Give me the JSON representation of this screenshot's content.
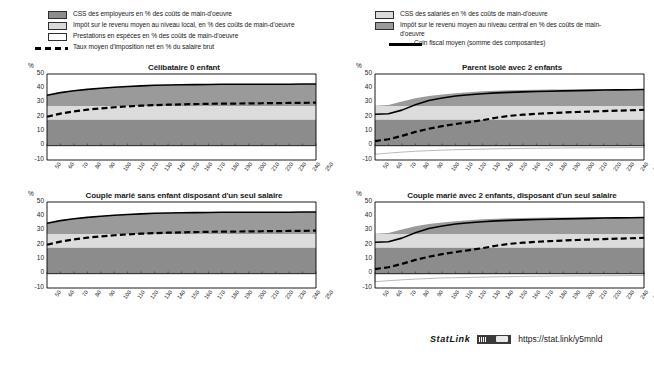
{
  "legend": {
    "left_items": [
      {
        "type": "swatch",
        "color": "#8c8c8c",
        "label": "CSS des employeurs en % des coûts de main-d'oeuvre"
      },
      {
        "type": "swatch",
        "color": "#d9d9d9",
        "label": "Impôt sur le revenu moyen au niveau local, en % des coûts de main-d'oeuvre"
      },
      {
        "type": "swatch",
        "color": "#ffffff",
        "label": "Prestations en espèces en % des coûts de main-d'oeuvre"
      },
      {
        "type": "dashed",
        "color": "#000000",
        "label": "Taux moyen d'imposition net en % du salaire brut"
      }
    ],
    "right_items": [
      {
        "type": "swatch",
        "color": "#dcdcdc",
        "label": "CSS des salariés en % des coûts de main-d'oeuvre"
      },
      {
        "type": "swatch",
        "color": "#9a9a9a",
        "label": "Impôt sur le revenu moyen au niveau central en %  des coûts de main-d'oeuvre"
      },
      {
        "type": "solid",
        "color": "#000000",
        "label": "Coin fiscal moyen (somme des composantes)"
      }
    ]
  },
  "axis": {
    "y_label": "%",
    "y_ticks": [
      50,
      40,
      30,
      20,
      10,
      0,
      -10
    ],
    "y_min": -10,
    "y_max": 50,
    "x_ticks": [
      50,
      60,
      70,
      80,
      90,
      100,
      110,
      120,
      130,
      140,
      150,
      160,
      170,
      180,
      190,
      200,
      210,
      220,
      230,
      240,
      250
    ],
    "x_min": 50,
    "x_max": 250
  },
  "footer": {
    "statlink_label": "StatLink",
    "url": "https://stat.link/y5mnld"
  },
  "chart_data": [
    {
      "type": "area",
      "id": "celibataire-0-enfant",
      "title": "Célibataire 0 enfant",
      "xlabel": "",
      "ylabel": "%",
      "xlim": [
        50,
        250
      ],
      "ylim": [
        -10,
        50
      ],
      "x": [
        50,
        60,
        70,
        80,
        90,
        100,
        110,
        120,
        130,
        140,
        150,
        160,
        170,
        180,
        190,
        200,
        210,
        220,
        230,
        240,
        250
      ],
      "series": [
        {
          "name": "CSS des employeurs",
          "color": "#8c8c8c",
          "values": [
            18.2,
            18.2,
            18.2,
            18.2,
            18.2,
            18.2,
            18.2,
            18.2,
            18.2,
            18.2,
            18.2,
            18.2,
            18.2,
            18.2,
            18.2,
            18.2,
            18.2,
            18.2,
            18.2,
            18.2,
            18.2
          ]
        },
        {
          "name": "CSS des salariés",
          "color": "#dcdcdc",
          "values": [
            9.5,
            9.5,
            9.5,
            9.5,
            9.5,
            9.5,
            9.5,
            9.5,
            9.5,
            9.5,
            9.5,
            9.5,
            9.5,
            9.5,
            9.5,
            9.5,
            9.5,
            9.5,
            9.5,
            9.5,
            9.5
          ]
        },
        {
          "name": "Impôt sur le revenu moyen au niveau central",
          "color": "#9a9a9a",
          "values": [
            7.5,
            9.3,
            10.6,
            11.6,
            12.4,
            13.1,
            13.6,
            14.0,
            14.4,
            14.6,
            14.8,
            14.9,
            15.0,
            15.1,
            15.1,
            15.2,
            15.2,
            15.2,
            15.2,
            15.3,
            15.3
          ]
        },
        {
          "name": "Impôt sur le revenu moyen au niveau local",
          "color": "#d9d9d9",
          "values": [
            0,
            0,
            0,
            0,
            0,
            0,
            0,
            0,
            0,
            0,
            0,
            0,
            0,
            0,
            0,
            0,
            0,
            0,
            0,
            0,
            0
          ]
        },
        {
          "name": "Prestations en espèces",
          "color": "#ffffff",
          "values": [
            0,
            0,
            0,
            0,
            0,
            0,
            0,
            0,
            0,
            0,
            0,
            0,
            0,
            0,
            0,
            0,
            0,
            0,
            0,
            0,
            0
          ]
        }
      ],
      "lines": [
        {
          "name": "Coin fiscal moyen (somme des composantes)",
          "style": "solid",
          "color": "#000000",
          "values": [
            35.2,
            37.0,
            38.3,
            39.3,
            40.1,
            40.8,
            41.3,
            41.7,
            42.1,
            42.3,
            42.5,
            42.6,
            42.7,
            42.8,
            42.8,
            42.9,
            42.9,
            42.9,
            42.9,
            43.0,
            43.0
          ]
        },
        {
          "name": "Taux moyen d'imposition net en % du salaire brut",
          "style": "dashed",
          "color": "#000000",
          "values": [
            20.2,
            22.4,
            23.9,
            25.1,
            26.0,
            26.8,
            27.4,
            27.9,
            28.3,
            28.6,
            28.8,
            29.0,
            29.2,
            29.3,
            29.4,
            29.5,
            29.6,
            29.7,
            29.8,
            29.9,
            30.0
          ]
        }
      ]
    },
    {
      "type": "area",
      "id": "parent-isole-2-enfants",
      "title": "Parent isolé avec 2 enfants",
      "xlabel": "",
      "ylabel": "%",
      "xlim": [
        50,
        250
      ],
      "ylim": [
        -10,
        50
      ],
      "x": [
        50,
        60,
        70,
        80,
        90,
        100,
        110,
        120,
        130,
        140,
        150,
        160,
        170,
        180,
        190,
        200,
        210,
        220,
        230,
        240,
        250
      ],
      "series": [
        {
          "name": "CSS des employeurs",
          "color": "#8c8c8c",
          "values": [
            18.2,
            18.2,
            18.2,
            18.2,
            18.2,
            18.2,
            18.2,
            18.2,
            18.2,
            18.2,
            18.2,
            18.2,
            18.2,
            18.2,
            18.2,
            18.2,
            18.2,
            18.2,
            18.2,
            18.2,
            18.2
          ]
        },
        {
          "name": "CSS des salariés",
          "color": "#dcdcdc",
          "values": [
            9.5,
            9.5,
            9.5,
            9.5,
            9.5,
            9.5,
            9.5,
            9.5,
            9.5,
            9.5,
            9.5,
            9.5,
            9.5,
            9.5,
            9.5,
            9.5,
            9.5,
            9.5,
            9.5,
            9.5,
            9.5
          ]
        },
        {
          "name": "Impôt sur le revenu moyen au niveau central",
          "color": "#9a9a9a",
          "values": [
            0.2,
            0.6,
            3.1,
            5.4,
            6.9,
            8.0,
            8.9,
            9.6,
            10.2,
            10.7,
            11.0,
            11.2,
            11.3,
            11.4,
            11.5,
            11.5,
            11.6,
            11.6,
            11.6,
            11.6,
            11.7
          ]
        },
        {
          "name": "Impôt sur le revenu moyen au niveau local",
          "color": "#d9d9d9",
          "values": [
            0,
            0,
            0,
            0,
            0,
            0,
            0,
            0,
            0,
            0,
            0,
            0,
            0,
            0,
            0,
            0,
            0,
            0,
            0,
            0,
            0
          ]
        },
        {
          "name": "Prestations en espèces",
          "color": "#ffffff",
          "values": [
            -6.0,
            -5.2,
            -4.5,
            -3.9,
            -3.5,
            -3.1,
            -2.8,
            -2.6,
            -2.4,
            -2.2,
            -2.1,
            -1.9,
            -1.8,
            -1.7,
            -1.6,
            -1.5,
            -1.5,
            -1.4,
            -1.4,
            -1.3,
            -1.3
          ]
        }
      ],
      "lines": [
        {
          "name": "Coin fiscal moyen (somme des composantes)",
          "style": "solid",
          "color": "#000000",
          "values": [
            21.9,
            22.3,
            24.8,
            28.6,
            31.5,
            33.3,
            34.6,
            35.5,
            36.2,
            36.8,
            37.2,
            37.5,
            37.8,
            38.0,
            38.2,
            38.4,
            38.6,
            38.8,
            38.9,
            39.0,
            39.2
          ]
        },
        {
          "name": "Taux moyen d'imposition net en % du salaire brut",
          "style": "dashed",
          "color": "#000000",
          "values": [
            3.2,
            4.5,
            6.8,
            9.6,
            11.8,
            13.6,
            15.1,
            16.4,
            17.8,
            19.5,
            20.8,
            21.6,
            22.2,
            22.7,
            23.1,
            23.5,
            23.8,
            24.1,
            24.4,
            24.7,
            25.0
          ]
        }
      ]
    },
    {
      "type": "area",
      "id": "couple-marie-sans-enfant-un-seul-salaire",
      "title": "Couple marié sans enfant disposant d'un seul salaire",
      "xlabel": "",
      "ylabel": "%",
      "xlim": [
        50,
        250
      ],
      "ylim": [
        -10,
        50
      ],
      "x": [
        50,
        60,
        70,
        80,
        90,
        100,
        110,
        120,
        130,
        140,
        150,
        160,
        170,
        180,
        190,
        200,
        210,
        220,
        230,
        240,
        250
      ],
      "series": [
        {
          "name": "CSS des employeurs",
          "color": "#8c8c8c",
          "values": [
            18.2,
            18.2,
            18.2,
            18.2,
            18.2,
            18.2,
            18.2,
            18.2,
            18.2,
            18.2,
            18.2,
            18.2,
            18.2,
            18.2,
            18.2,
            18.2,
            18.2,
            18.2,
            18.2,
            18.2,
            18.2
          ]
        },
        {
          "name": "CSS des salariés",
          "color": "#dcdcdc",
          "values": [
            9.5,
            9.5,
            9.5,
            9.5,
            9.5,
            9.5,
            9.5,
            9.5,
            9.5,
            9.5,
            9.5,
            9.5,
            9.5,
            9.5,
            9.5,
            9.5,
            9.5,
            9.5,
            9.5,
            9.5,
            9.5
          ]
        },
        {
          "name": "Impôt sur le revenu moyen au niveau central",
          "color": "#9a9a9a",
          "values": [
            7.5,
            9.3,
            10.6,
            11.6,
            12.4,
            13.1,
            13.6,
            14.0,
            14.4,
            14.6,
            14.8,
            14.9,
            15.0,
            15.1,
            15.1,
            15.2,
            15.2,
            15.2,
            15.2,
            15.3,
            15.3
          ]
        },
        {
          "name": "Impôt sur le revenu moyen au niveau local",
          "color": "#d9d9d9",
          "values": [
            0,
            0,
            0,
            0,
            0,
            0,
            0,
            0,
            0,
            0,
            0,
            0,
            0,
            0,
            0,
            0,
            0,
            0,
            0,
            0,
            0
          ]
        },
        {
          "name": "Prestations en espèces",
          "color": "#ffffff",
          "values": [
            0,
            0,
            0,
            0,
            0,
            0,
            0,
            0,
            0,
            0,
            0,
            0,
            0,
            0,
            0,
            0,
            0,
            0,
            0,
            0,
            0
          ]
        }
      ],
      "lines": [
        {
          "name": "Coin fiscal moyen (somme des composantes)",
          "style": "solid",
          "color": "#000000",
          "values": [
            35.2,
            37.0,
            38.3,
            39.3,
            40.1,
            40.8,
            41.3,
            41.7,
            42.1,
            42.3,
            42.5,
            42.6,
            42.7,
            42.8,
            42.8,
            42.9,
            42.9,
            42.9,
            42.9,
            43.0,
            43.0
          ]
        },
        {
          "name": "Taux moyen d'imposition net en % du salaire brut",
          "style": "dashed",
          "color": "#000000",
          "values": [
            20.2,
            22.4,
            23.9,
            25.1,
            26.0,
            26.8,
            27.4,
            27.9,
            28.3,
            28.6,
            28.8,
            29.0,
            29.2,
            29.3,
            29.4,
            29.5,
            29.6,
            29.7,
            29.8,
            29.9,
            30.0
          ]
        }
      ]
    },
    {
      "type": "area",
      "id": "couple-marie-2-enfants-un-seul-salaire",
      "title": "Couple marié avec 2 enfants, disposant d'un seul salaire",
      "xlabel": "",
      "ylabel": "%",
      "xlim": [
        50,
        250
      ],
      "ylim": [
        -10,
        50
      ],
      "x": [
        50,
        60,
        70,
        80,
        90,
        100,
        110,
        120,
        130,
        140,
        150,
        160,
        170,
        180,
        190,
        200,
        210,
        220,
        230,
        240,
        250
      ],
      "series": [
        {
          "name": "CSS des employeurs",
          "color": "#8c8c8c",
          "values": [
            18.2,
            18.2,
            18.2,
            18.2,
            18.2,
            18.2,
            18.2,
            18.2,
            18.2,
            18.2,
            18.2,
            18.2,
            18.2,
            18.2,
            18.2,
            18.2,
            18.2,
            18.2,
            18.2,
            18.2,
            18.2
          ]
        },
        {
          "name": "CSS des salariés",
          "color": "#dcdcdc",
          "values": [
            9.5,
            9.5,
            9.5,
            9.5,
            9.5,
            9.5,
            9.5,
            9.5,
            9.5,
            9.5,
            9.5,
            9.5,
            9.5,
            9.5,
            9.5,
            9.5,
            9.5,
            9.5,
            9.5,
            9.5,
            9.5
          ]
        },
        {
          "name": "Impôt sur le revenu moyen au niveau central",
          "color": "#9a9a9a",
          "values": [
            0.2,
            0.6,
            3.1,
            5.4,
            6.9,
            8.0,
            8.9,
            9.6,
            10.2,
            10.7,
            11.0,
            11.2,
            11.3,
            11.4,
            11.5,
            11.5,
            11.6,
            11.6,
            11.6,
            11.6,
            11.7
          ]
        },
        {
          "name": "Impôt sur le revenu moyen au niveau local",
          "color": "#d9d9d9",
          "values": [
            0,
            0,
            0,
            0,
            0,
            0,
            0,
            0,
            0,
            0,
            0,
            0,
            0,
            0,
            0,
            0,
            0,
            0,
            0,
            0,
            0
          ]
        },
        {
          "name": "Prestations en espèces",
          "color": "#ffffff",
          "values": [
            -5.6,
            -4.9,
            -4.3,
            -3.8,
            -3.4,
            -3.0,
            -2.8,
            -2.6,
            -2.4,
            -2.2,
            -2.1,
            -1.9,
            -1.8,
            -1.7,
            -1.6,
            -1.5,
            -1.5,
            -1.4,
            -1.4,
            -1.3,
            -1.3
          ]
        }
      ],
      "lines": [
        {
          "name": "Coin fiscal moyen (somme des composantes)",
          "style": "solid",
          "color": "#000000",
          "values": [
            21.9,
            22.3,
            24.8,
            28.6,
            31.5,
            33.3,
            34.6,
            35.5,
            36.2,
            36.8,
            37.2,
            37.5,
            37.8,
            38.0,
            38.2,
            38.4,
            38.6,
            38.8,
            38.9,
            39.0,
            39.2
          ]
        },
        {
          "name": "Taux moyen d'imposition net en % du salaire brut",
          "style": "dashed",
          "color": "#000000",
          "values": [
            3.2,
            4.5,
            6.8,
            9.6,
            11.8,
            13.6,
            15.1,
            16.4,
            17.8,
            19.5,
            20.8,
            21.6,
            22.2,
            22.7,
            23.1,
            23.5,
            23.8,
            24.1,
            24.4,
            24.7,
            25.0
          ]
        }
      ]
    }
  ]
}
